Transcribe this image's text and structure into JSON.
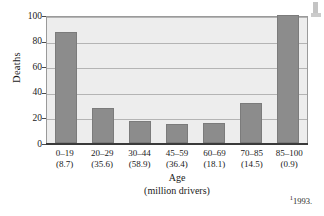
{
  "chart_data": {
    "type": "bar",
    "title": "",
    "xlabel": "Age",
    "xlabel_unit": "(million drivers)",
    "ylabel": "Deaths",
    "ylim": [
      0,
      100
    ],
    "yticks": [
      100,
      80,
      60,
      40,
      20,
      0
    ],
    "grid": true,
    "legend": "none",
    "categories": [
      "0–19",
      "20–29",
      "30–44",
      "45–59",
      "60–69",
      "70–85",
      "85–100"
    ],
    "category_sublabels": [
      "(8.7)",
      "(35.6)",
      "(58.9)",
      "(36.4)",
      "(18.1)",
      "(14.5)",
      "(0.9)"
    ],
    "values": [
      87,
      27,
      17,
      15,
      16,
      31,
      100
    ],
    "bars": [
      {
        "category": "0–19",
        "sublabel": "(8.7)",
        "value": 87
      },
      {
        "category": "20–29",
        "sublabel": "(35.6)",
        "value": 27
      },
      {
        "category": "30–44",
        "sublabel": "(58.9)",
        "value": 17
      },
      {
        "category": "45–59",
        "sublabel": "(36.4)",
        "value": 15
      },
      {
        "category": "60–69",
        "sublabel": "(18.1)",
        "value": 16
      },
      {
        "category": "70–85",
        "sublabel": "(14.5)",
        "value": 31
      },
      {
        "category": "85–100",
        "sublabel": "(0.9)",
        "value": 100
      }
    ]
  },
  "footnote": {
    "marker": "1",
    "text": "1993."
  },
  "colors": {
    "bar_fill": "#8c8c8c",
    "bar_edge": "#7b7b7b",
    "plot_background": "#ededed",
    "gridline": "#b4b4b4",
    "axis": "#3a3a3a",
    "page_background": "#ffffff",
    "text": "#1a1a1a"
  }
}
